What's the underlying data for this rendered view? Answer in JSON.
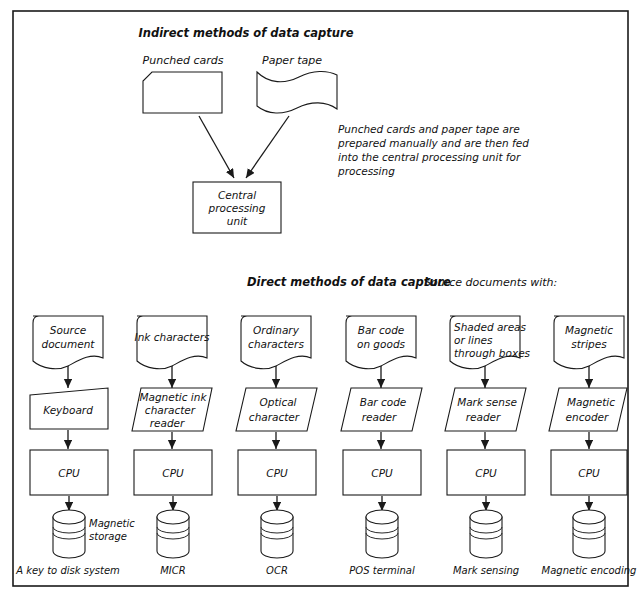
{
  "figure": {
    "background": "#ffffff",
    "line_color": "#1a1a1a",
    "indirect": {
      "heading": "Indirect methods of data capture",
      "sources": [
        {
          "label": "Punched cards",
          "shape": "punched-card"
        },
        {
          "label": "Paper tape",
          "shape": "paper-tape"
        }
      ],
      "target": {
        "line1": "Central",
        "line2": "processing",
        "line3": "unit"
      },
      "note": [
        "Punched cards and paper tape are",
        "prepared manually and are then fed",
        "into the central processing unit for",
        "processing"
      ]
    },
    "direct": {
      "heading": "Direct methods of data capture",
      "subheading": "Source documents with:",
      "cpu_label": "CPU",
      "storage_label": {
        "line1": "Magnetic",
        "line2": "storage"
      },
      "columns": [
        {
          "source": [
            "Source",
            "document"
          ],
          "processor": [
            "Keyboard"
          ],
          "processor_shape": "trapezoid",
          "caption": "A key to disk system"
        },
        {
          "source": [
            "Ink characters"
          ],
          "processor": [
            "Magnetic ink",
            "character",
            "reader"
          ],
          "processor_shape": "parallelogram",
          "caption": "MICR"
        },
        {
          "source": [
            "Ordinary",
            "characters"
          ],
          "processor": [
            "Optical",
            "character"
          ],
          "processor_shape": "parallelogram",
          "caption": "OCR"
        },
        {
          "source": [
            "Bar code",
            "on goods"
          ],
          "processor": [
            "Bar code",
            "reader"
          ],
          "processor_shape": "parallelogram",
          "caption": "POS terminal"
        },
        {
          "source": [
            "Shaded areas",
            "or lines",
            "through boxes"
          ],
          "processor": [
            "Mark sense",
            "reader"
          ],
          "processor_shape": "parallelogram",
          "caption": "Mark sensing"
        },
        {
          "source": [
            "Magnetic",
            "stripes"
          ],
          "processor": [
            "Magnetic",
            "encoder"
          ],
          "processor_shape": "parallelogram",
          "caption": "Magnetic encoding"
        }
      ]
    }
  }
}
